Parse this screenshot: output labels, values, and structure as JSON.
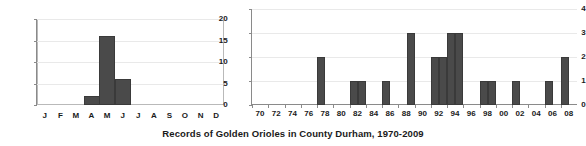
{
  "chart_data": [
    {
      "type": "bar",
      "title": "",
      "name": "monthly-records",
      "xlabel": "",
      "ylabel": "",
      "categories": [
        "J",
        "F",
        "M",
        "A",
        "M",
        "J",
        "J",
        "A",
        "S",
        "O",
        "N",
        "D"
      ],
      "category_names": [
        "January",
        "February",
        "March",
        "April",
        "May",
        "June",
        "July",
        "August",
        "September",
        "October",
        "November",
        "December"
      ],
      "values": [
        0,
        0,
        0,
        2,
        16,
        6,
        0,
        0,
        0,
        0,
        0,
        0
      ],
      "ylim": [
        0,
        20
      ],
      "yticks": [
        0,
        5,
        10,
        15,
        20
      ],
      "grid": true,
      "legend": "none",
      "bar_color": "#4a4a4a"
    },
    {
      "type": "bar",
      "title": "",
      "name": "annual-records",
      "xlabel": "",
      "ylabel": "",
      "categories": [
        "70",
        "71",
        "72",
        "73",
        "74",
        "75",
        "76",
        "77",
        "78",
        "79",
        "80",
        "81",
        "82",
        "83",
        "84",
        "85",
        "86",
        "87",
        "88",
        "89",
        "90",
        "91",
        "92",
        "93",
        "94",
        "95",
        "96",
        "97",
        "98",
        "99",
        "00",
        "01",
        "02",
        "03",
        "04",
        "05",
        "06",
        "07",
        "08",
        "09"
      ],
      "tick_labels": [
        "70",
        "72",
        "74",
        "76",
        "78",
        "80",
        "82",
        "84",
        "86",
        "88",
        "90",
        "92",
        "94",
        "96",
        "98",
        "00",
        "02",
        "04",
        "06",
        "08"
      ],
      "values": [
        0,
        0,
        0,
        0,
        0,
        0,
        0,
        0,
        2,
        0,
        0,
        0,
        1,
        1,
        0,
        0,
        1,
        0,
        0,
        3,
        0,
        0,
        2,
        2,
        3,
        3,
        0,
        0,
        1,
        1,
        0,
        0,
        1,
        0,
        0,
        0,
        1,
        0,
        2,
        0
      ],
      "ylim": [
        0,
        4
      ],
      "yticks": [
        0,
        1,
        2,
        3,
        4
      ],
      "grid": true,
      "legend": "none",
      "bar_color": "#4a4a4a"
    }
  ],
  "title": {
    "text": "Records of Golden Orioles in County Durham, 1970-2009"
  }
}
